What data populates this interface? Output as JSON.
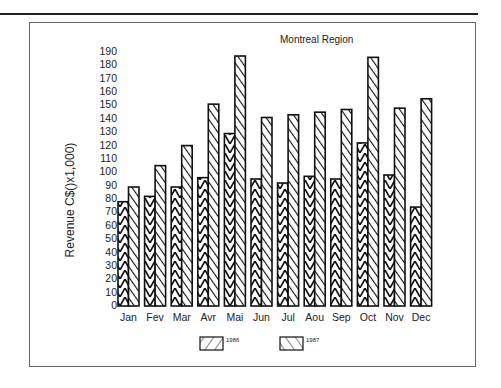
{
  "chart_data": {
    "type": "bar",
    "title": "Montreal Region",
    "xlabel": "",
    "ylabel": "Revenue C$()x1,000)",
    "ylim": [
      0,
      190
    ],
    "yticks": [
      0,
      10,
      20,
      30,
      40,
      50,
      60,
      70,
      80,
      90,
      100,
      110,
      120,
      130,
      140,
      150,
      160,
      170,
      180,
      190
    ],
    "categories": [
      "Jan",
      "Fev",
      "Mar",
      "Avr",
      "Mai",
      "Jun",
      "Jul",
      "Aou",
      "Sep",
      "Oct",
      "Nov",
      "Dec"
    ],
    "series": [
      {
        "name": "1986",
        "pattern": "forward-hatch",
        "values": [
          78,
          82,
          89,
          96,
          129,
          95,
          92,
          97,
          95,
          122,
          98,
          74
        ]
      },
      {
        "name": "1987",
        "pattern": "back-hatch",
        "values": [
          89,
          105,
          120,
          151,
          187,
          141,
          143,
          145,
          147,
          186,
          148,
          155
        ]
      }
    ],
    "grid": false,
    "legend_position": "bottom"
  },
  "legend": {
    "items": [
      {
        "label": "1986"
      },
      {
        "label": "1987"
      }
    ]
  }
}
